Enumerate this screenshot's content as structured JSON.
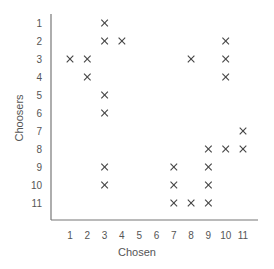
{
  "chart_data": {
    "type": "scatter",
    "title": "",
    "xlabel": "Chosen",
    "ylabel": "Choosers",
    "x_ticks": [
      "1",
      "2",
      "3",
      "4",
      "5",
      "6",
      "7",
      "8",
      "9",
      "10",
      "11"
    ],
    "y_ticks": [
      "1",
      "2",
      "3",
      "4",
      "5",
      "6",
      "7",
      "8",
      "9",
      "10",
      "11"
    ],
    "y_inverted": true,
    "marker": "x",
    "grid": false,
    "xlim": [
      1,
      11
    ],
    "ylim": [
      1,
      11
    ],
    "points": [
      {
        "chooser": 1,
        "chosen": 3
      },
      {
        "chooser": 2,
        "chosen": 3
      },
      {
        "chooser": 2,
        "chosen": 4
      },
      {
        "chooser": 2,
        "chosen": 10
      },
      {
        "chooser": 3,
        "chosen": 1
      },
      {
        "chooser": 3,
        "chosen": 2
      },
      {
        "chooser": 3,
        "chosen": 8
      },
      {
        "chooser": 3,
        "chosen": 10
      },
      {
        "chooser": 4,
        "chosen": 2
      },
      {
        "chooser": 4,
        "chosen": 10
      },
      {
        "chooser": 5,
        "chosen": 3
      },
      {
        "chooser": 6,
        "chosen": 3
      },
      {
        "chooser": 7,
        "chosen": 11
      },
      {
        "chooser": 8,
        "chosen": 9
      },
      {
        "chooser": 8,
        "chosen": 10
      },
      {
        "chooser": 8,
        "chosen": 11
      },
      {
        "chooser": 9,
        "chosen": 3
      },
      {
        "chooser": 9,
        "chosen": 7
      },
      {
        "chooser": 9,
        "chosen": 9
      },
      {
        "chooser": 10,
        "chosen": 3
      },
      {
        "chooser": 10,
        "chosen": 7
      },
      {
        "chooser": 10,
        "chosen": 9
      },
      {
        "chooser": 11,
        "chosen": 7
      },
      {
        "chooser": 11,
        "chosen": 8
      },
      {
        "chooser": 11,
        "chosen": 9
      }
    ]
  }
}
